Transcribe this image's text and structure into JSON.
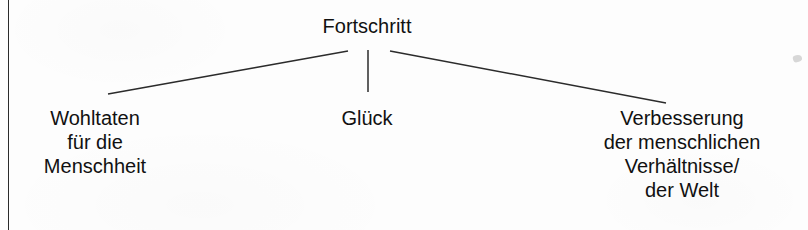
{
  "diagram": {
    "type": "tree",
    "language": "German",
    "root": {
      "label": "Fortschritt"
    },
    "branches": [
      {
        "id": "left",
        "lines": [
          "Wohltaten",
          "für die",
          "Menschheit"
        ]
      },
      {
        "id": "center",
        "lines": [
          "Glück"
        ]
      },
      {
        "id": "right",
        "lines": [
          "Verbesserung",
          "der menschlichen",
          "Verhältnisse/",
          "der Welt"
        ]
      }
    ],
    "colors": {
      "text": "#111111",
      "line": "#2b2b2b",
      "background": "#fdfdfd"
    }
  }
}
